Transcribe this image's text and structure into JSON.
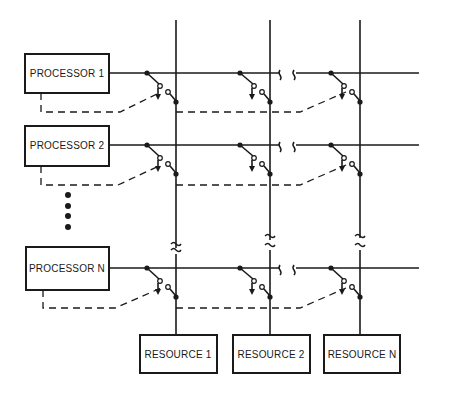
{
  "diagram": {
    "type": "crossbar switch",
    "processors": [
      {
        "label": "PROCESSOR 1",
        "y": 73
      },
      {
        "label": "PROCESSOR 2",
        "y": 145
      },
      {
        "label": "PROCESSOR N",
        "y": 268
      }
    ],
    "resources": [
      {
        "label": "RESOURCE 1",
        "x": 176
      },
      {
        "label": "RESOURCE 2",
        "x": 270
      },
      {
        "label": "RESOURCE N",
        "x": 360
      }
    ],
    "ellipsis": "vertical dots between PROCESSOR 2 and PROCESSOR N",
    "colors": {
      "line": "#1a1a1a",
      "background": "#ffffff"
    }
  }
}
